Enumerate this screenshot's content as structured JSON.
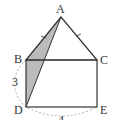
{
  "figure": {
    "points": {
      "A": {
        "label": "A",
        "x": 61,
        "y": 17
      },
      "B": {
        "label": "B",
        "x": 26,
        "y": 60
      },
      "C": {
        "label": "C",
        "x": 97,
        "y": 60
      },
      "D": {
        "label": "D",
        "x": 26,
        "y": 107
      },
      "E": {
        "label": "E",
        "x": 97,
        "y": 107
      }
    },
    "labels": {
      "A": "A",
      "B": "B",
      "C": "C",
      "D": "D",
      "E": "E",
      "side_BD": "3",
      "side_DE": "4"
    },
    "colors": {
      "line": "#333333",
      "shade": "#bbbbbb",
      "arc": "#999999"
    }
  }
}
